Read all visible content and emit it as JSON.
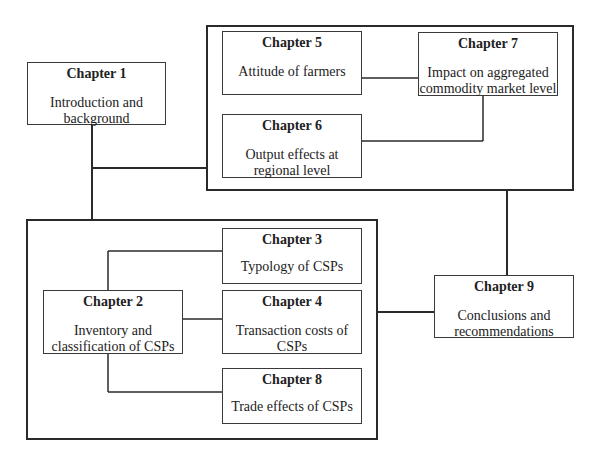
{
  "diagram": {
    "chapters": [
      {
        "id": "ch1",
        "title": "Chapter 1",
        "desc": "Introduction and background"
      },
      {
        "id": "ch2",
        "title": "Chapter 2",
        "desc": "Inventory and classification of CSPs"
      },
      {
        "id": "ch3",
        "title": "Chapter 3",
        "desc": "Typology of CSPs"
      },
      {
        "id": "ch4",
        "title": "Chapter 4",
        "desc": "Transaction costs of CSPs"
      },
      {
        "id": "ch5",
        "title": "Chapter 5",
        "desc": "Attitude of farmers"
      },
      {
        "id": "ch6",
        "title": "Chapter 6",
        "desc": "Output effects at regional level"
      },
      {
        "id": "ch7",
        "title": "Chapter 7",
        "desc": "Impact on aggregated commodity market level"
      },
      {
        "id": "ch8",
        "title": "Chapter 8",
        "desc": "Trade effects of CSPs"
      },
      {
        "id": "ch9",
        "title": "Chapter 9",
        "desc": "Conclusions and recommendations"
      }
    ],
    "groups": [
      {
        "id": "top-group",
        "members": [
          "ch5",
          "ch6",
          "ch7"
        ]
      },
      {
        "id": "bottom-group",
        "members": [
          "ch2",
          "ch3",
          "ch4",
          "ch8"
        ]
      }
    ],
    "connections": [
      [
        "ch1",
        "top-group"
      ],
      [
        "ch1",
        "bottom-group"
      ],
      [
        "ch5",
        "ch7"
      ],
      [
        "ch7",
        "ch6"
      ],
      [
        "ch2",
        "ch3"
      ],
      [
        "ch2",
        "ch4"
      ],
      [
        "ch2",
        "ch8"
      ],
      [
        "top-group",
        "ch9"
      ],
      [
        "bottom-group",
        "ch9"
      ]
    ]
  }
}
